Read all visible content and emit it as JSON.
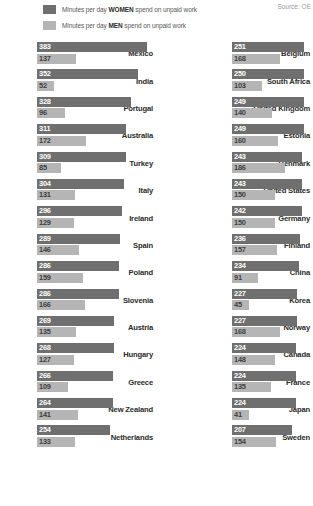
{
  "legend": {
    "women": {
      "prefix": "Minutes per day ",
      "strong": "WOMEN",
      "suffix": " spend on unpaid work",
      "color": "#6f6f6f"
    },
    "men": {
      "prefix": "Minutes per day ",
      "strong": "MEN",
      "suffix": " spend on unpaid work",
      "color": "#b5b5b5"
    }
  },
  "source": "Source: OE",
  "chart_data": {
    "type": "bar",
    "title": "",
    "xlabel": "",
    "ylabel": "",
    "orientation": "horizontal",
    "grid": false,
    "legend_position": "top-left",
    "xlim": [
      0,
      400
    ],
    "series": [
      {
        "name": "Minutes per day WOMEN spend on unpaid work",
        "color": "#6f6f6f"
      },
      {
        "name": "Minutes per day MEN spend on unpaid work",
        "color": "#b5b5b5"
      }
    ],
    "categories": [
      "Mexico",
      "India",
      "Portugal",
      "Australia",
      "Turkey",
      "Italy",
      "Ireland",
      "Spain",
      "Poland",
      "Slovenia",
      "Austria",
      "Hungary",
      "Greece",
      "New Zealand",
      "Netherlands",
      "Belgium",
      "South Africa",
      "United Kingdom",
      "Estonia",
      "Denmark",
      "United States",
      "Germany",
      "Finland",
      "China",
      "Korea",
      "Norway",
      "Canada",
      "France",
      "Japan",
      "Sweden"
    ],
    "left_column": [
      {
        "country": "Mexico",
        "women": 383,
        "men": 137
      },
      {
        "country": "India",
        "women": 352,
        "men": 52
      },
      {
        "country": "Portugal",
        "women": 328,
        "men": 96
      },
      {
        "country": "Australia",
        "women": 311,
        "men": 172
      },
      {
        "country": "Turkey",
        "women": 309,
        "men": 85
      },
      {
        "country": "Italy",
        "women": 304,
        "men": 131
      },
      {
        "country": "Ireland",
        "women": 296,
        "men": 129
      },
      {
        "country": "Spain",
        "women": 289,
        "men": 146
      },
      {
        "country": "Poland",
        "women": 286,
        "men": 159
      },
      {
        "country": "Slovenia",
        "women": 286,
        "men": 166
      },
      {
        "country": "Austria",
        "women": 269,
        "men": 135
      },
      {
        "country": "Hungary",
        "women": 268,
        "men": 127
      },
      {
        "country": "Greece",
        "women": 266,
        "men": 109
      },
      {
        "country": "New Zealand",
        "women": 264,
        "men": 141
      },
      {
        "country": "Netherlands",
        "women": 254,
        "men": 133
      }
    ],
    "right_column": [
      {
        "country": "Belgium",
        "women": 251,
        "men": 168
      },
      {
        "country": "South Africa",
        "women": 250,
        "men": 103
      },
      {
        "country": "United Kingdom",
        "women": 249,
        "men": 140
      },
      {
        "country": "Estonia",
        "women": 249,
        "men": 160
      },
      {
        "country": "Denmark",
        "women": 243,
        "men": 186
      },
      {
        "country": "United States",
        "women": 243,
        "men": 150
      },
      {
        "country": "Germany",
        "women": 242,
        "men": 150
      },
      {
        "country": "Finland",
        "women": 236,
        "men": 157
      },
      {
        "country": "China",
        "women": 234,
        "men": 91
      },
      {
        "country": "Korea",
        "women": 227,
        "men": 45
      },
      {
        "country": "Norway",
        "women": 227,
        "men": 168
      },
      {
        "country": "Canada",
        "women": 224,
        "men": 148
      },
      {
        "country": "France",
        "women": 224,
        "men": 135
      },
      {
        "country": "Japan",
        "women": 224,
        "men": 41
      },
      {
        "country": "Sweden",
        "women": 207,
        "men": 154
      }
    ]
  }
}
